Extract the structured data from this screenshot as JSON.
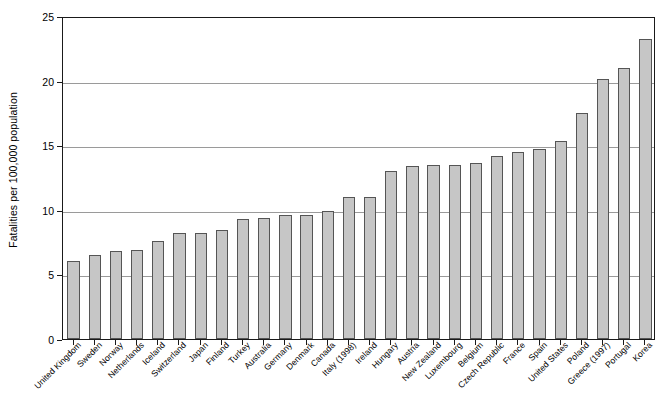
{
  "chart_data": {
    "type": "bar",
    "title": "",
    "xlabel": "",
    "ylabel": "Fatalities per 100,000 population",
    "ylim": [
      0,
      25
    ],
    "yticks": [
      0,
      5,
      10,
      15,
      20,
      25
    ],
    "ytick_labels": [
      "0",
      "5",
      "10",
      "15",
      "20",
      "25"
    ],
    "grid": true,
    "legend": "none",
    "bar_color": "#c6c6c6",
    "bar_border_color": "#555555",
    "axis_color": "#1a1a1a",
    "gridline_color": "#9a9a9a",
    "categories": [
      "United Kingdom",
      "Sweden",
      "Norway",
      "Netherlands",
      "Iceland",
      "Switzerland",
      "Japan",
      "Finland",
      "Turkey",
      "Australia",
      "Germany",
      "Denmark",
      "Canada",
      "Italy (1998)",
      "Ireland",
      "Hungary",
      "Austria",
      "New Zealand",
      "Luxembourg",
      "Belgium",
      "Czech Republic",
      "France",
      "Spain",
      "United States",
      "Poland",
      "Greece (1997)",
      "Portugal",
      "Korea"
    ],
    "values": [
      6.0,
      6.5,
      6.8,
      6.9,
      7.6,
      8.2,
      8.2,
      8.4,
      9.3,
      9.4,
      9.6,
      9.6,
      9.9,
      11.0,
      11.0,
      13.0,
      13.4,
      13.5,
      13.5,
      13.6,
      14.2,
      14.5,
      14.7,
      15.3,
      17.5,
      20.1,
      21.0,
      23.2
    ]
  }
}
